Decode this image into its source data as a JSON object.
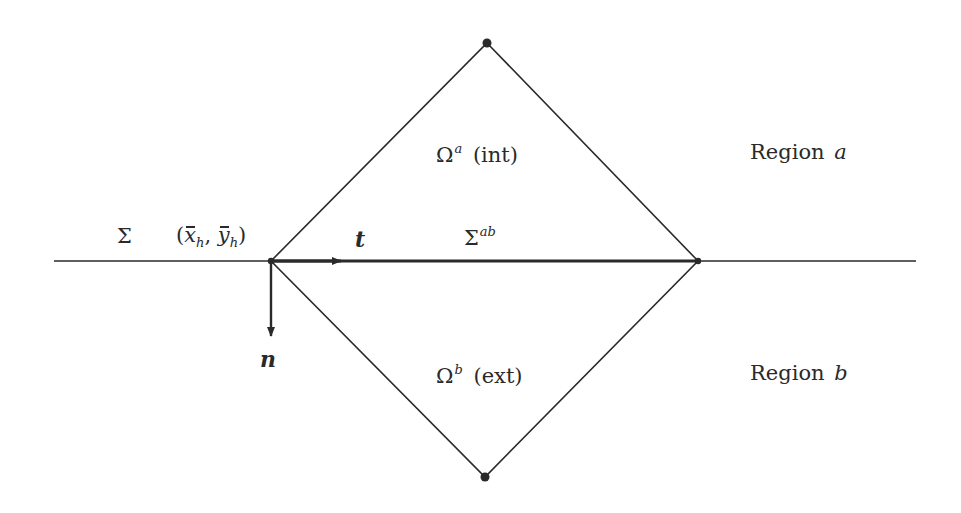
{
  "diagram": {
    "type": "geometric-domain-schematic",
    "colors": {
      "ink": "#2a2a2a",
      "background": "#ffffff"
    },
    "interface_line": {
      "label": "Σ",
      "x_start": 54,
      "x_end": 916,
      "y": 261
    },
    "diamond_vertices": {
      "top": [
        487,
        43
      ],
      "right": [
        698,
        261
      ],
      "bottom": [
        485,
        477
      ],
      "left": [
        271,
        261
      ]
    },
    "point": {
      "label_open": "(",
      "x_sym": "x",
      "x_sub": "h",
      "comma": ", ",
      "y_sym": "y",
      "y_sub": "h",
      "label_close": ")"
    },
    "vectors": {
      "tangent": {
        "label": "t",
        "from": [
          271,
          261
        ],
        "to": [
          341,
          261
        ]
      },
      "normal": {
        "label": "n",
        "from": [
          271,
          261
        ],
        "to": [
          271,
          336
        ]
      }
    },
    "sub_interface": {
      "symbol": "Σ",
      "superscript": "ab"
    },
    "subdomains": {
      "upper": {
        "symbol": "Ω",
        "superscript": "a",
        "qualifier": "(int)"
      },
      "lower": {
        "symbol": "Ω",
        "superscript": "b",
        "qualifier": "(ext)"
      }
    },
    "regions": {
      "upper": {
        "word": "Region",
        "letter": "a"
      },
      "lower": {
        "word": "Region",
        "letter": "b"
      }
    }
  }
}
